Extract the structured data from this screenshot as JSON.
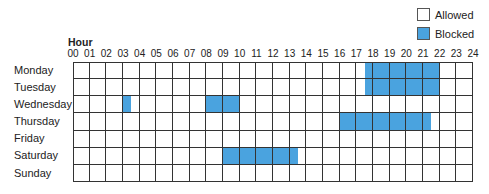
{
  "legend": {
    "allowed": {
      "label": "Allowed",
      "color": "#ffffff"
    },
    "blocked": {
      "label": "Blocked",
      "color": "#4aa3df"
    }
  },
  "grid": {
    "hour_title": "Hour",
    "hours": [
      "00",
      "01",
      "02",
      "03",
      "04",
      "05",
      "06",
      "07",
      "08",
      "09",
      "10",
      "11",
      "12",
      "13",
      "14",
      "15",
      "16",
      "17",
      "18",
      "19",
      "20",
      "21",
      "22",
      "23",
      "24"
    ],
    "days": [
      "Monday",
      "Tuesday",
      "Wednesday",
      "Thursday",
      "Friday",
      "Saturday",
      "Sunday"
    ],
    "blocked_ranges": {
      "Monday": [
        [
          17.5,
          22
        ]
      ],
      "Tuesday": [
        [
          17.5,
          22
        ]
      ],
      "Wednesday": [
        [
          3,
          3.5
        ],
        [
          8,
          10
        ]
      ],
      "Thursday": [
        [
          16,
          21.5
        ]
      ],
      "Friday": [],
      "Saturday": [
        [
          9,
          13.5
        ]
      ],
      "Sunday": []
    }
  }
}
